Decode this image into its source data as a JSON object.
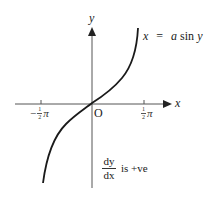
{
  "diagram": {
    "axes": {
      "x_label": "x",
      "y_label": "y",
      "origin_label": "O"
    },
    "ticks": {
      "left": {
        "sign": "−",
        "num": "1",
        "den": "2",
        "sym": "π"
      },
      "right": {
        "sign": "",
        "num": "1",
        "den": "2",
        "sym": "π"
      }
    },
    "curve_label": {
      "lhs": "x",
      "eq": "=",
      "rhs_a": "a",
      "rhs_fn": "sin",
      "rhs_var": "y"
    },
    "gradient_note": {
      "numerator": "dy",
      "denominator": "dx",
      "text": "is +ve"
    },
    "colors": {
      "axis": "#555555",
      "curve": "#1a1a1a",
      "text": "#222222"
    }
  }
}
